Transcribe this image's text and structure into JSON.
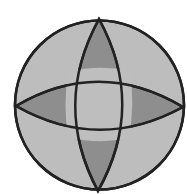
{
  "diagram": {
    "colors": {
      "background": "#ffffff",
      "light_fill": "#bdbdbd",
      "dark_fill": "#8e8e8e",
      "center_fill": "#bebebe",
      "stroke": "#222222"
    },
    "circle": {
      "cx": 99.5,
      "cy": 105,
      "r": 84.5
    },
    "vertices": {
      "top": [
        99,
        18
      ],
      "bottom": [
        98,
        192
      ],
      "left": [
        15,
        106
      ],
      "right": [
        184,
        107
      ]
    },
    "inner_square": {
      "top_left": [
        68,
        72
      ],
      "top_right": [
        130,
        71
      ],
      "bottom_left": [
        68,
        137
      ],
      "bottom_right": [
        129,
        138
      ]
    }
  }
}
